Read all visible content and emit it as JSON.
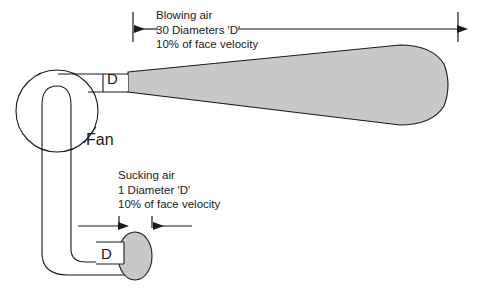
{
  "diagram": {
    "title_absent": true,
    "colors": {
      "duct_fill": "#c8c8c8",
      "outline": "#1a1a1a",
      "background": "#ffffff",
      "text": "#1a1a1a"
    },
    "blowing_note": {
      "line1": "Blowing air",
      "line2": "30 Diameters 'D'",
      "line3": "10% of face velocity"
    },
    "sucking_note": {
      "line1": "Sucking air",
      "line2": "1 Diameter 'D'",
      "line3": "10% of face velocity"
    },
    "fan_label": "Fan",
    "outlet_diameter_label": "D",
    "inlet_diameter_label": "D",
    "dimension_lines": {
      "blowing_span_label": "30 Diameters 'D'",
      "sucking_span_label": "1 Diameter 'D'"
    }
  }
}
